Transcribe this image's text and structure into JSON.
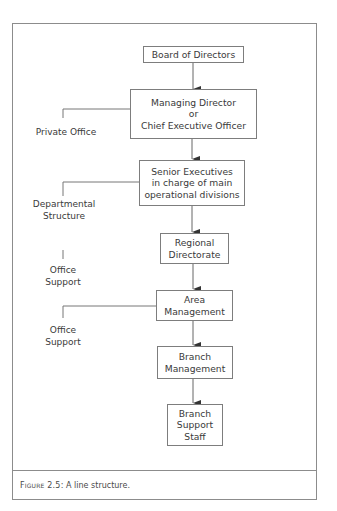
{
  "diagram": {
    "type": "organisation-line-structure",
    "nodes": [
      {
        "id": "board",
        "lines": [
          "Board of Directors"
        ]
      },
      {
        "id": "md",
        "lines": [
          "Managing Director",
          "or",
          "Chief Executive Officer"
        ]
      },
      {
        "id": "senior",
        "lines": [
          "Senior Executives",
          "in charge of main",
          "operational divisions"
        ]
      },
      {
        "id": "regional",
        "lines": [
          "Regional",
          "Directorate"
        ]
      },
      {
        "id": "area",
        "lines": [
          "Area",
          "Management"
        ]
      },
      {
        "id": "branch",
        "lines": [
          "Branch",
          "Management"
        ]
      },
      {
        "id": "support",
        "lines": [
          "Branch",
          "Support",
          "Staff"
        ]
      }
    ],
    "side_labels": [
      {
        "attached_to": "md",
        "lines": [
          "Private Office"
        ]
      },
      {
        "attached_to": "senior",
        "lines": [
          "Departmental",
          "Structure"
        ]
      },
      {
        "attached_to": "regional",
        "lines": [
          "Office",
          "Support"
        ]
      },
      {
        "attached_to": "area",
        "lines": [
          "Office",
          "Support"
        ]
      }
    ],
    "edges": [
      {
        "from": "board",
        "to": "md"
      },
      {
        "from": "md",
        "to": "senior"
      },
      {
        "from": "senior",
        "to": "regional"
      },
      {
        "from": "regional",
        "to": "area"
      },
      {
        "from": "area",
        "to": "branch"
      },
      {
        "from": "branch",
        "to": "support"
      }
    ]
  },
  "caption": {
    "label": "Figure 2.5:",
    "text": " A line structure."
  }
}
